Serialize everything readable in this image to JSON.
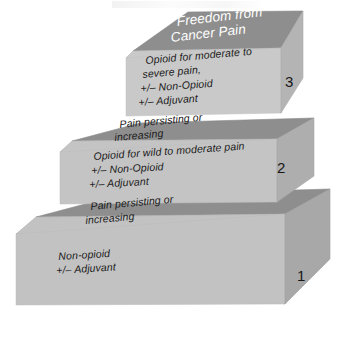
{
  "figure": {
    "background_color": "#ffffff"
  },
  "palette": {
    "top_face": "#8e8e8e",
    "front_face_step3": "#c9c9c9",
    "front_face_step2": "#c4c4c4",
    "front_face_step1": "#c2c2c2",
    "side_face_step3": "#b4b4b4",
    "side_face_step2": "#aeaeae",
    "side_face_step1": "#a8a8a8",
    "outline": "#9a9a9a",
    "text_dark": "#1a1a1a",
    "text_light": "#ffffff"
  },
  "steps": [
    {
      "number": "1",
      "top_face_text": "Pain persisting or\nincreasing",
      "front_face_text": "Non-opioid\n+/– Adjuvant"
    },
    {
      "number": "2",
      "top_face_text": "Pain persisting or\nincreasing",
      "front_face_text": "Opioid for wild to moderate pain\n+/– Non-Opioid\n+/– Adjuvant"
    },
    {
      "number": "3",
      "top_face_text": "Freedom from\nCancer Pain",
      "front_face_text": "Opioid for moderate to\nsevere pain,\n+/– Non-Opioid\n+/– Adjuvant"
    }
  ],
  "labels": {
    "step3_top_line1": "Freedom from",
    "step3_top_line2": "Cancer Pain",
    "step3_front_line1": "Opioid for moderate to",
    "step3_front_line2": "severe pain,",
    "step3_front_line3": "+/– Non-Opioid",
    "step3_front_line4": "+/– Adjuvant",
    "step3_number": "3",
    "step2_top_line1": "Pain persisting or",
    "step2_top_line2": "increasing",
    "step2_front_line1": "Opioid for wild to moderate pain",
    "step2_front_line2": "+/– Non-Opioid",
    "step2_front_line3": "+/– Adjuvant",
    "step2_number": "2",
    "step1_top_line1": "Pain persisting or",
    "step1_top_line2": "increasing",
    "step1_front_line1": "Non-opioid",
    "step1_front_line2": "+/– Adjuvant",
    "step1_number": "1"
  }
}
